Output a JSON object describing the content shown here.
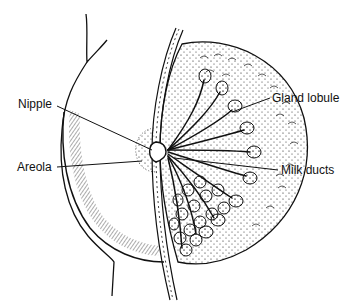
{
  "diagram": {
    "colors": {
      "ink": "#111111",
      "background": "#ffffff"
    },
    "labels": [
      {
        "id": "nipple",
        "text": "Nipple",
        "x": 18,
        "y": 97
      },
      {
        "id": "areola",
        "text": "Areola",
        "x": 17,
        "y": 160
      },
      {
        "id": "gland-lobule",
        "text": "Gland lobule",
        "x": 272,
        "y": 91
      },
      {
        "id": "milk-ducts",
        "text": "Milk ducts",
        "x": 281,
        "y": 163
      }
    ]
  }
}
